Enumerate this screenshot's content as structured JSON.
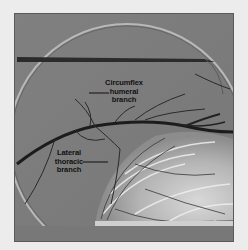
{
  "figure": {
    "type": "angiogram",
    "background_color": "#ececec",
    "image_gray": "#7d7d7d"
  },
  "labels": [
    {
      "id": "circumflex",
      "text": "Circumflex\nhumeral\nbranch"
    },
    {
      "id": "lateral",
      "text": "Lateral\nthoracic\nbranch"
    }
  ]
}
